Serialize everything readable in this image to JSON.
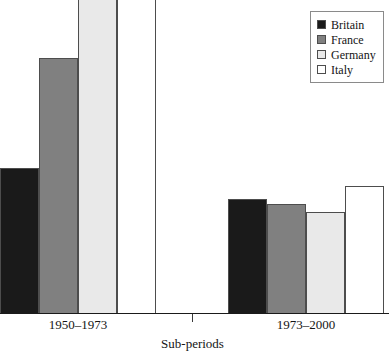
{
  "chart_data": {
    "type": "bar",
    "title": "",
    "subtitle": "",
    "xlabel": "Sub-periods",
    "ylabel": "",
    "categories": [
      "1950–1973",
      "1973–2000"
    ],
    "grid": false,
    "legend_position": "top-right",
    "ylim": [
      0,
      4.9
    ],
    "note": "Y axis is unlabelled and untick-marked; values below are read off bar pixel heights relative to the baseline. Germany and Italy in 1950-1973 are clipped by the top of the figure.",
    "series": [
      {
        "name": "Britain",
        "color": "#1a1a1a",
        "values": [
          2.3,
          1.8
        ],
        "clipped": [
          false,
          false
        ]
      },
      {
        "name": "France",
        "color": "#808080",
        "values": [
          4.0,
          1.7
        ],
        "clipped": [
          false,
          false
        ]
      },
      {
        "name": "Germany",
        "color": "#e9e9e9",
        "values": [
          4.9,
          1.6
        ],
        "clipped": [
          true,
          false
        ]
      },
      {
        "name": "Italy",
        "color": "#ffffff",
        "values": [
          4.9,
          2.0
        ],
        "clipped": [
          true,
          false
        ]
      }
    ]
  },
  "legend": {
    "items": [
      {
        "label": "Britain",
        "swatch": "legend-swatch-britain",
        "color": "#1a1a1a"
      },
      {
        "label": "France",
        "swatch": "legend-swatch-france",
        "color": "#808080"
      },
      {
        "label": "Germany",
        "swatch": "legend-swatch-germany",
        "color": "#e9e9e9"
      },
      {
        "label": "Italy",
        "swatch": "legend-swatch-italy",
        "color": "#ffffff"
      }
    ]
  },
  "axis": {
    "x_tick_labels": [
      "1950–1973",
      "1973–2000"
    ],
    "x_title": "Sub-periods"
  },
  "bars": [
    {
      "group": 0,
      "series": "Britain",
      "left": 0,
      "width": 39,
      "top": 168,
      "color": "#1a1a1a"
    },
    {
      "group": 0,
      "series": "France",
      "left": 39,
      "width": 39,
      "top": 58,
      "color": "#808080"
    },
    {
      "group": 0,
      "series": "Germany",
      "left": 78,
      "width": 39,
      "top": -2,
      "color": "#e9e9e9"
    },
    {
      "group": 0,
      "series": "Italy",
      "left": 117,
      "width": 39,
      "top": -2,
      "color": "#ffffff"
    },
    {
      "group": 1,
      "series": "Britain",
      "left": 228,
      "width": 39,
      "top": 199,
      "color": "#1a1a1a"
    },
    {
      "group": 1,
      "series": "France",
      "left": 267,
      "width": 39,
      "top": 204,
      "color": "#808080"
    },
    {
      "group": 1,
      "series": "Germany",
      "left": 306,
      "width": 39,
      "top": 212,
      "color": "#e9e9e9"
    },
    {
      "group": 1,
      "series": "Italy",
      "left": 345,
      "width": 39,
      "top": 186,
      "color": "#ffffff"
    }
  ]
}
